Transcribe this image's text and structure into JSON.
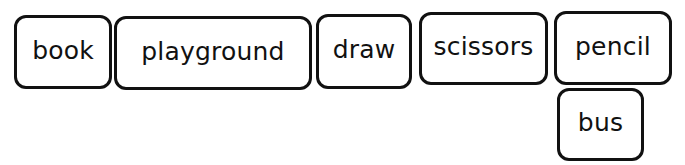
{
  "word_tiles": [
    {
      "label": "book",
      "x": 14,
      "y": 15,
      "w": 98,
      "h": 74
    },
    {
      "label": "playground",
      "x": 114,
      "y": 16,
      "w": 198,
      "h": 74
    },
    {
      "label": "draw",
      "x": 316,
      "y": 14,
      "w": 96,
      "h": 75
    },
    {
      "label": "scissors",
      "x": 419,
      "y": 12,
      "w": 129,
      "h": 73
    },
    {
      "label": "pencil",
      "x": 554,
      "y": 11,
      "w": 118,
      "h": 74
    },
    {
      "label": "bus",
      "x": 557,
      "y": 88,
      "w": 87,
      "h": 73
    }
  ],
  "colors": {
    "border": "#111111",
    "text": "#111111",
    "background": "#ffffff"
  }
}
